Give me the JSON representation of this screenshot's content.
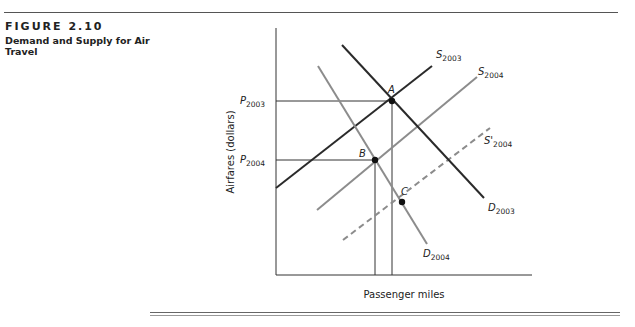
{
  "figure": {
    "label": "FIGURE 2.10",
    "title": "Demand and Supply for Air Travel"
  },
  "chart_data": {
    "type": "line",
    "title": "Demand and Supply for Air Travel",
    "xlabel": "Passenger miles",
    "ylabel": "Airfares (dollars)",
    "grid": false,
    "price_labels": [
      {
        "base": "P",
        "sub": "2003"
      },
      {
        "base": "P",
        "sub": "2004"
      }
    ],
    "series": [
      {
        "name": "S2003",
        "base": "S",
        "sub": "2003",
        "style": "solid",
        "color": "#2a2a2a",
        "x1": 276,
        "y1": 188,
        "x2": 432,
        "y2": 66
      },
      {
        "name": "S2004",
        "base": "S",
        "sub": "2004",
        "style": "solid",
        "color": "#8c8c8c",
        "x1": 317,
        "y1": 210,
        "x2": 477,
        "y2": 77
      },
      {
        "name": "S'2004",
        "base": "S'",
        "sub": "2004",
        "style": "dashed",
        "color": "#8c8c8c",
        "x1": 343,
        "y1": 240,
        "x2": 490,
        "y2": 128
      },
      {
        "name": "D2003",
        "base": "D",
        "sub": "2003",
        "style": "solid",
        "color": "#2a2a2a",
        "x1": 342,
        "y1": 45,
        "x2": 484,
        "y2": 198
      },
      {
        "name": "D2004",
        "base": "D",
        "sub": "2004",
        "style": "solid",
        "color": "#8c8c8c",
        "x1": 318,
        "y1": 66,
        "x2": 427,
        "y2": 244
      }
    ],
    "points": [
      {
        "label": "A",
        "x": 392,
        "y": 101
      },
      {
        "label": "B",
        "x": 375,
        "y": 160
      },
      {
        "label": "C",
        "x": 402,
        "y": 202
      }
    ]
  }
}
